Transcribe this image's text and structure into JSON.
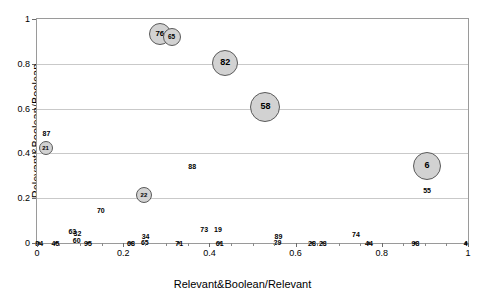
{
  "chart_data": {
    "type": "scatter",
    "title": "",
    "xlabel": "Relevant&Boolean/Relevant",
    "ylabel": "Relevant&Boolean/Boolean",
    "xlim": [
      0,
      1
    ],
    "ylim": [
      0,
      1
    ],
    "xticks": [
      "0",
      "0.2",
      "0.4",
      "0.6",
      "0.8",
      "1"
    ],
    "yticks": [
      "0",
      "0.2",
      "0.4",
      "0.6",
      "0.8",
      "1"
    ],
    "grid": "horizontal",
    "legend": "none",
    "marker_style": "gray-filled-circle-with-numeric-label",
    "bubbles": [
      {
        "label": "76",
        "x": 0.285,
        "y": 0.935,
        "r": 11
      },
      {
        "label": "65",
        "x": 0.312,
        "y": 0.92,
        "r": 9
      },
      {
        "label": "82",
        "x": 0.437,
        "y": 0.805,
        "r": 13
      },
      {
        "label": "58",
        "x": 0.53,
        "y": 0.608,
        "r": 15
      },
      {
        "label": "6",
        "x": 0.905,
        "y": 0.345,
        "r": 14
      },
      {
        "label": "21",
        "x": 0.02,
        "y": 0.425,
        "r": 7
      },
      {
        "label": "22",
        "x": 0.248,
        "y": 0.215,
        "r": 8
      }
    ],
    "points": [
      {
        "label": "87",
        "x": 0.022,
        "y": 0.49,
        "label_dx": 0,
        "label_dy": 0,
        "dot": false
      },
      {
        "label": "88",
        "x": 0.36,
        "y": 0.345,
        "label_dx": 0,
        "label_dy": 0,
        "dot": false
      },
      {
        "label": "55",
        "x": 0.905,
        "y": 0.235,
        "label_dx": 0,
        "label_dy": 0,
        "dot": false
      },
      {
        "label": "70",
        "x": 0.148,
        "y": 0.148,
        "label_dx": 0,
        "label_dy": 0,
        "dot": false
      },
      {
        "label": "73",
        "x": 0.388,
        "y": 0.062,
        "label_dx": 0,
        "label_dy": 0,
        "dot": false
      },
      {
        "label": "19",
        "x": 0.42,
        "y": 0.062,
        "label_dx": 0,
        "label_dy": 0,
        "dot": false
      },
      {
        "label": "74",
        "x": 0.74,
        "y": 0.042,
        "label_dx": 0,
        "label_dy": 0,
        "dot": false
      },
      {
        "label": "63",
        "x": 0.082,
        "y": 0.054,
        "label_dx": 0,
        "label_dy": 0,
        "dot": false
      },
      {
        "label": "32",
        "x": 0.094,
        "y": 0.044,
        "label_dx": 0,
        "label_dy": 0,
        "dot": false
      },
      {
        "label": "60",
        "x": 0.092,
        "y": 0.014,
        "label_dx": 0,
        "label_dy": 0,
        "dot": false
      },
      {
        "label": "89",
        "x": 0.56,
        "y": 0.03,
        "label_dx": 0,
        "label_dy": 0,
        "dot": false
      },
      {
        "label": "29",
        "x": 0.558,
        "y": 0.006,
        "label_dx": 0,
        "label_dy": 0,
        "dot": false
      },
      {
        "label": "34",
        "x": 0.252,
        "y": 0.03,
        "label_dx": 0,
        "label_dy": 0,
        "dot": false
      },
      {
        "label": "65",
        "x": 0.25,
        "y": 0.004,
        "label_dx": 0,
        "label_dy": 0,
        "dot": false
      },
      {
        "label": "84",
        "x": 0.005,
        "y": 0.0,
        "label_dx": 0,
        "label_dy": 0,
        "dot": true
      },
      {
        "label": "45",
        "x": 0.043,
        "y": 0.0,
        "label_dx": 0,
        "label_dy": 0,
        "dot": true
      },
      {
        "label": "95",
        "x": 0.118,
        "y": 0.0,
        "label_dx": 0,
        "label_dy": 0,
        "dot": true
      },
      {
        "label": "68",
        "x": 0.218,
        "y": 0.0,
        "label_dx": 0,
        "label_dy": 0,
        "dot": true
      },
      {
        "label": "71",
        "x": 0.33,
        "y": 0.0,
        "label_dx": 0,
        "label_dy": 0,
        "dot": true
      },
      {
        "label": "61",
        "x": 0.424,
        "y": 0.0,
        "label_dx": 0,
        "label_dy": 0,
        "dot": true
      },
      {
        "label": "28",
        "x": 0.638,
        "y": 0.0,
        "label_dx": 0,
        "label_dy": 0,
        "dot": true
      },
      {
        "label": "23",
        "x": 0.663,
        "y": 0.0,
        "label_dx": 0,
        "label_dy": 0,
        "dot": true
      },
      {
        "label": "44",
        "x": 0.77,
        "y": 0.0,
        "label_dx": 0,
        "label_dy": 0,
        "dot": true
      },
      {
        "label": "98",
        "x": 0.878,
        "y": 0.0,
        "label_dx": 0,
        "label_dy": 0,
        "dot": true
      },
      {
        "label": "4",
        "x": 0.995,
        "y": 0.0,
        "label_dx": 0,
        "label_dy": 0,
        "dot": true
      }
    ]
  },
  "axes": {
    "x_title": "Relevant&Boolean/Relevant",
    "y_title": "Relevant&Boolean/Boolean"
  },
  "colors": {
    "bubble_fill": "#d2d2d2",
    "bubble_stroke": "#5a5a5a",
    "gridline": "#c9c9c9",
    "frame": "#9a9a9a",
    "text": "#000000"
  }
}
